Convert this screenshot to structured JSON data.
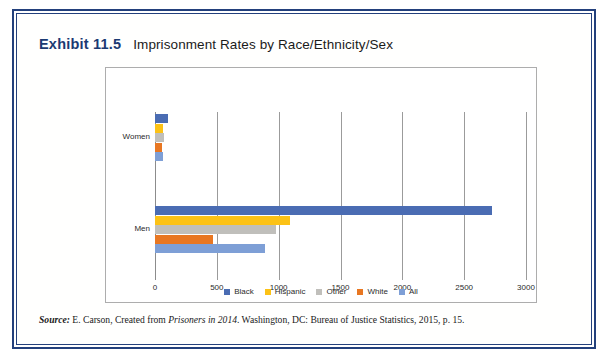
{
  "exhibit": {
    "number": "Exhibit 11.5",
    "title": "Imprisonment Rates by Race/Ethnicity/Sex"
  },
  "source": {
    "label": "Source:",
    "part1": " E. Carson, Created from ",
    "italic": "Prisoners in 2014",
    "part2": ". Washington, DC: Bureau of Justice Statistics, 2015, p. 15."
  },
  "chart_data": {
    "type": "bar",
    "orientation": "horizontal",
    "title": "Imprisonment Rates by Race/Ethnicity/Sex",
    "xlabel": "",
    "ylabel": "",
    "xlim": [
      0,
      3000
    ],
    "xticks": [
      "0",
      "500",
      "1000",
      "1500",
      "2000",
      "2500",
      "3000"
    ],
    "grid": true,
    "legend_position": "bottom",
    "categories": [
      "Women",
      "Men"
    ],
    "series": [
      {
        "name": "Black",
        "color": "#4a6cb3",
        "values": [
          109,
          2724
        ]
      },
      {
        "name": "Hispanic",
        "color": "#fcc216",
        "values": [
          64,
          1090
        ]
      },
      {
        "name": "Other",
        "color": "#c0bfbb",
        "values": [
          70,
          980
        ]
      },
      {
        "name": "White",
        "color": "#e87722",
        "values": [
          53,
          465
        ]
      },
      {
        "name": "All",
        "color": "#7e9fd6",
        "values": [
          65,
          890
        ]
      }
    ]
  }
}
